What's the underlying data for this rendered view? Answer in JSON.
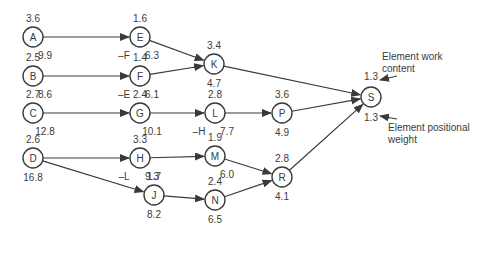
{
  "diagram": {
    "type": "precedence-network",
    "nodes": [
      {
        "id": "A",
        "work": "3.6",
        "weight": "9.9",
        "note": ""
      },
      {
        "id": "B",
        "work": "2.5",
        "weight": "8.6",
        "note": ""
      },
      {
        "id": "C",
        "work": "2.7",
        "weight": "12.8",
        "note": ""
      },
      {
        "id": "D",
        "work": "2.6",
        "weight": "16.8",
        "note": ""
      },
      {
        "id": "E",
        "work": "1.6",
        "weight": "6.3",
        "note": "–F"
      },
      {
        "id": "F",
        "work": "1.4",
        "weight": "6.1",
        "note": "–E"
      },
      {
        "id": "G",
        "work": "2.4",
        "weight": "10.1",
        "note": ""
      },
      {
        "id": "H",
        "work": "3.3",
        "weight": "9.3",
        "note": "–L"
      },
      {
        "id": "J",
        "work": "1.7",
        "weight": "8.2",
        "note": ""
      },
      {
        "id": "K",
        "work": "3.4",
        "weight": "4.7",
        "note": ""
      },
      {
        "id": "L",
        "work": "2.8",
        "weight": "7.7",
        "note": "–H"
      },
      {
        "id": "M",
        "work": "1.9",
        "weight": "6.0",
        "note": ""
      },
      {
        "id": "N",
        "work": "2.4",
        "weight": "6.5",
        "note": ""
      },
      {
        "id": "P",
        "work": "3.6",
        "weight": "4.9",
        "note": ""
      },
      {
        "id": "R",
        "work": "2.8",
        "weight": "4.1",
        "note": ""
      },
      {
        "id": "S",
        "work": "1.3",
        "weight": "1.3",
        "note": ""
      }
    ],
    "edges": [
      [
        "A",
        "E"
      ],
      [
        "B",
        "F"
      ],
      [
        "C",
        "G"
      ],
      [
        "D",
        "H"
      ],
      [
        "D",
        "J"
      ],
      [
        "E",
        "K"
      ],
      [
        "F",
        "K"
      ],
      [
        "G",
        "L"
      ],
      [
        "H",
        "M"
      ],
      [
        "J",
        "N"
      ],
      [
        "K",
        "S"
      ],
      [
        "L",
        "P"
      ],
      [
        "M",
        "R"
      ],
      [
        "N",
        "R"
      ],
      [
        "P",
        "S"
      ],
      [
        "R",
        "S"
      ]
    ],
    "annotations": {
      "work_content": "Element work content",
      "positional_weight": "Element positional weight"
    }
  }
}
